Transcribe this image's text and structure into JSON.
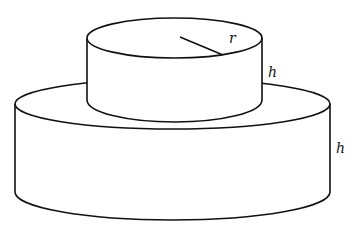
{
  "figure": {
    "labels": {
      "radius": "r",
      "top_height": "h",
      "bottom_height": "h"
    },
    "colors": {
      "stroke": "#111111",
      "background": "#ffffff"
    }
  }
}
